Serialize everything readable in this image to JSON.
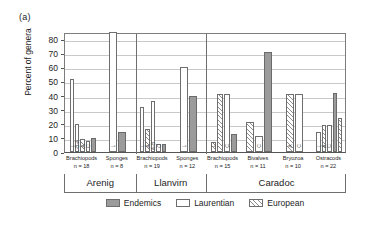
{
  "figure": {
    "panel_label": "(a)"
  },
  "chart_data": {
    "type": "bar",
    "title": "",
    "xlabel": "",
    "ylabel": "Percent of genera",
    "ylim": [
      0,
      85
    ],
    "yticks": [
      0,
      10,
      20,
      30,
      40,
      50,
      60,
      70,
      80
    ],
    "ytick_labels": [
      "0",
      "10",
      "20",
      "30",
      "40",
      "50",
      "60",
      "70",
      "80"
    ],
    "grid": true,
    "legend_position": "bottom-center",
    "legend": [
      {
        "key": "endemics",
        "label": "Endemics",
        "color": "#9b9b9b",
        "pattern": "solid"
      },
      {
        "key": "laurentian",
        "label": "Laurentian",
        "color": "#ffffff",
        "pattern": "open"
      },
      {
        "key": "european",
        "label": "European",
        "color": "#ffffff",
        "pattern": "hatched"
      }
    ],
    "stages": [
      {
        "name": "Arenig",
        "taxa_count": 2
      },
      {
        "name": "Llanvirn",
        "taxa_count": 2
      },
      {
        "name": "Caradoc",
        "taxa_count": 4
      }
    ],
    "categories": [
      {
        "stage": "Arenig",
        "taxon": "Brachiopods",
        "n_label": "n = 18",
        "n": 18
      },
      {
        "stage": "Arenig",
        "taxon": "Sponges",
        "n_label": "n = 8",
        "n": 8
      },
      {
        "stage": "Llanvirn",
        "taxon": "Brachiopods",
        "n_label": "n = 19",
        "n": 19
      },
      {
        "stage": "Llanvirn",
        "taxon": "Sponges",
        "n_label": "n = 12",
        "n": 12
      },
      {
        "stage": "Caradoc",
        "taxon": "Brachiopods",
        "n_label": "n = 15",
        "n": 15
      },
      {
        "stage": "Caradoc",
        "taxon": "Bivalves",
        "n_label": "n = 11",
        "n": 11
      },
      {
        "stage": "Caradoc",
        "taxon": "Bryozoa",
        "n_label": "n = 10",
        "n": 10
      },
      {
        "stage": "Caradoc",
        "taxon": "Ostracods",
        "n_label": "n = 22",
        "n": 22
      }
    ],
    "groups": [
      {
        "stage": "Arenig",
        "taxon": "Brachiopods",
        "bars": [
          {
            "series": "laurentian",
            "value": 52,
            "annotation": "L"
          },
          {
            "series": "laurentian",
            "value": 20,
            "annotation": "L-B-A"
          },
          {
            "series": "european",
            "value": 9,
            "annotation": "A"
          },
          {
            "series": "laurentian",
            "value": 8,
            "annotation": "C"
          },
          {
            "series": "endemics",
            "value": 10,
            "annotation": ""
          }
        ]
      },
      {
        "stage": "Arenig",
        "taxon": "Sponges",
        "bars": [
          {
            "series": "laurentian",
            "value": 85,
            "annotation": "L"
          },
          {
            "series": "endemics",
            "value": 14,
            "annotation": ""
          }
        ]
      },
      {
        "stage": "Llanvirn",
        "taxon": "Brachiopods",
        "bars": [
          {
            "series": "laurentian",
            "value": 32,
            "annotation": "L"
          },
          {
            "series": "european",
            "value": 16,
            "annotation": "A"
          },
          {
            "series": "laurentian",
            "value": 36,
            "annotation": "A-B"
          },
          {
            "series": "laurentian",
            "value": 6,
            "annotation": "C"
          },
          {
            "series": "endemics",
            "value": 6,
            "annotation": ""
          }
        ]
      },
      {
        "stage": "Llanvirn",
        "taxon": "Sponges",
        "bars": [
          {
            "series": "laurentian",
            "value": 60,
            "annotation": "L"
          },
          {
            "series": "endemics",
            "value": 40,
            "annotation": ""
          }
        ]
      },
      {
        "stage": "Caradoc",
        "taxon": "Brachiopods",
        "bars": [
          {
            "series": "european",
            "value": 7,
            "annotation": "L"
          },
          {
            "series": "european",
            "value": 41,
            "annotation": ""
          },
          {
            "series": "laurentian",
            "value": 41,
            "annotation": "C"
          },
          {
            "series": "endemics",
            "value": 13,
            "annotation": ""
          }
        ]
      },
      {
        "stage": "Caradoc",
        "taxon": "Bivalves",
        "bars": [
          {
            "series": "european",
            "value": 21,
            "annotation": ""
          },
          {
            "series": "laurentian",
            "value": 11,
            "annotation": "C"
          },
          {
            "series": "endemics",
            "value": 71,
            "annotation": ""
          }
        ]
      },
      {
        "stage": "Caradoc",
        "taxon": "Bryozoa",
        "bars": [
          {
            "series": "european",
            "value": 41,
            "annotation": "A"
          },
          {
            "series": "laurentian",
            "value": 41,
            "annotation": "C"
          }
        ]
      },
      {
        "stage": "Caradoc",
        "taxon": "Ostracods",
        "bars": [
          {
            "series": "laurentian",
            "value": 14,
            "annotation": "L"
          },
          {
            "series": "european",
            "value": 19,
            "annotation": "A"
          },
          {
            "series": "laurentian",
            "value": 19,
            "annotation": "C"
          },
          {
            "series": "endemics",
            "value": 42,
            "annotation": ""
          },
          {
            "series": "european",
            "value": 24,
            "annotation": ""
          }
        ]
      }
    ]
  }
}
